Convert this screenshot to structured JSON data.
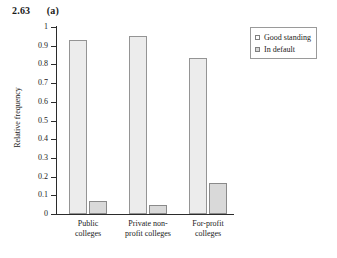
{
  "figure": {
    "number": "2.63",
    "part": "(a)"
  },
  "legend": {
    "position": "top-right",
    "entries": [
      {
        "label": "Good standing",
        "swatch": "good",
        "color": "#ececec"
      },
      {
        "label": "In default",
        "swatch": "default",
        "color": "#d9d9d9"
      }
    ]
  },
  "chart_data": {
    "type": "bar",
    "title": "",
    "xlabel": "",
    "ylabel": "Relative frequency",
    "ylim": [
      0,
      1
    ],
    "grid": false,
    "categories": [
      "Public colleges",
      "Private non-profit colleges",
      "For-profit colleges"
    ],
    "category_lines": [
      [
        "Public",
        "colleges"
      ],
      [
        "Private non-",
        "profit colleges"
      ],
      [
        "For-profit",
        "colleges"
      ]
    ],
    "ytick_labels": [
      "1",
      "0.9",
      "0.8",
      "0.7",
      "0.6",
      "0.5",
      "0.4",
      "0.3",
      "0.2",
      "0.1",
      "0"
    ],
    "ytick_values": [
      1,
      0.9,
      0.8,
      0.7,
      0.6,
      0.5,
      0.4,
      0.3,
      0.2,
      0.1,
      0
    ],
    "series": [
      {
        "name": "Good standing",
        "values": [
          0.93,
          0.95,
          0.835
        ]
      },
      {
        "name": "In default",
        "values": [
          0.07,
          0.05,
          0.165
        ]
      }
    ]
  }
}
